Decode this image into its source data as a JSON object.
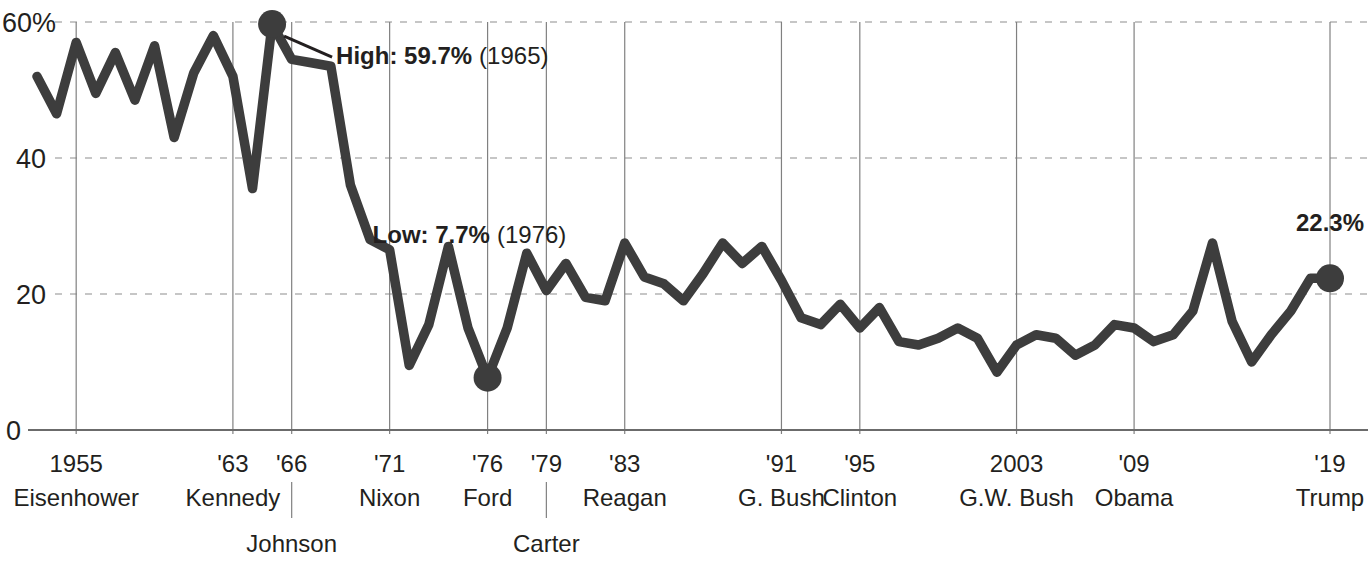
{
  "chart_data": {
    "type": "line",
    "title": "",
    "subtitle": "",
    "xlabel": "",
    "ylabel": "",
    "ylim": [
      0,
      63
    ],
    "xlim": [
      1953,
      2019
    ],
    "grid": "horizontal dashed gridlines at 20, 40, 60; vertical solid gridlines at labeled years",
    "legend": "none",
    "y_ticks": [
      {
        "value": 0,
        "label": "0"
      },
      {
        "value": 20,
        "label": "20"
      },
      {
        "value": 40,
        "label": "40"
      },
      {
        "value": 60,
        "label": "60%"
      }
    ],
    "x_ticks": [
      {
        "value": 1955,
        "label": "1955"
      },
      {
        "value": 1963,
        "label": "'63"
      },
      {
        "value": 1966,
        "label": "'66"
      },
      {
        "value": 1971,
        "label": "'71"
      },
      {
        "value": 1976,
        "label": "'76"
      },
      {
        "value": 1979,
        "label": "'79"
      },
      {
        "value": 1983,
        "label": "'83"
      },
      {
        "value": 1991,
        "label": "'91"
      },
      {
        "value": 1995,
        "label": "'95"
      },
      {
        "value": 2003,
        "label": "2003"
      },
      {
        "value": 2009,
        "label": "'09"
      },
      {
        "value": 2019,
        "label": "'19"
      }
    ],
    "presidents_row1": [
      {
        "label": "Eisenhower",
        "x": 1955
      },
      {
        "label": "Kennedy",
        "x": 1963
      },
      {
        "label": "Nixon",
        "x": 1971
      },
      {
        "label": "Ford",
        "x": 1976
      },
      {
        "label": "Reagan",
        "x": 1983
      },
      {
        "label": "G. Bush",
        "x": 1991
      },
      {
        "label": "Clinton",
        "x": 1995
      },
      {
        "label": "G.W. Bush",
        "x": 2003
      },
      {
        "label": "Obama",
        "x": 2009
      },
      {
        "label": "Trump",
        "x": 2019
      }
    ],
    "presidents_row2": [
      {
        "label": "Johnson",
        "x": 1966
      },
      {
        "label": "Carter",
        "x": 1979
      }
    ],
    "x": [
      1953,
      1954,
      1955,
      1956,
      1957,
      1958,
      1959,
      1960,
      1961,
      1962,
      1963,
      1964,
      1965,
      1966,
      1967,
      1968,
      1969,
      1970,
      1971,
      1972,
      1973,
      1974,
      1975,
      1976,
      1977,
      1978,
      1979,
      1980,
      1981,
      1982,
      1983,
      1984,
      1985,
      1986,
      1987,
      1988,
      1989,
      1990,
      1991,
      1992,
      1993,
      1994,
      1995,
      1996,
      1997,
      1998,
      1999,
      2000,
      2001,
      2002,
      2003,
      2004,
      2005,
      2006,
      2007,
      2008,
      2009,
      2010,
      2011,
      2012,
      2013,
      2014,
      2015,
      2016,
      2017,
      2018,
      2019
    ],
    "values": [
      52.0,
      46.5,
      57.0,
      49.5,
      55.5,
      48.5,
      56.5,
      43.0,
      52.5,
      58.0,
      52.0,
      35.5,
      59.7,
      54.5,
      54.0,
      53.5,
      36.0,
      28.0,
      26.5,
      9.5,
      15.5,
      27.0,
      15.0,
      7.7,
      15.0,
      26.0,
      20.5,
      24.5,
      19.5,
      19.0,
      27.5,
      22.5,
      21.5,
      19.0,
      23.0,
      27.5,
      24.5,
      27.0,
      22.0,
      16.5,
      15.5,
      18.5,
      15.0,
      18.0,
      13.0,
      12.5,
      13.5,
      15.0,
      13.5,
      8.5,
      12.5,
      14.0,
      13.5,
      11.0,
      12.5,
      15.5,
      15.0,
      13.0,
      14.0,
      17.5,
      27.5,
      16.0,
      10.0,
      14.0,
      17.5,
      22.3,
      22.3
    ],
    "series_color": "#3d3d3d",
    "annotations": [
      {
        "name": "high",
        "bold_text": "High: 59.7%",
        "normal_text": "(1965)",
        "point_x": 1965,
        "point_y": 59.7
      },
      {
        "name": "low",
        "bold_text": "Low: 7.7%",
        "normal_text": "(1976)",
        "point_x": 1976,
        "point_y": 7.7
      },
      {
        "name": "end",
        "bold_text": "22.3%",
        "normal_text": "",
        "point_x": 2019,
        "point_y": 22.3
      }
    ]
  }
}
